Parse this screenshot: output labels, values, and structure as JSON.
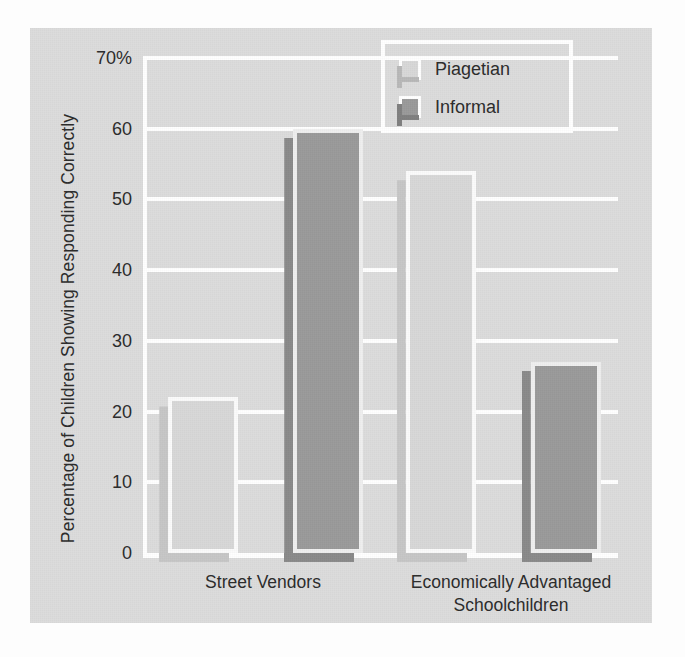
{
  "chart_data": {
    "type": "bar",
    "title": "",
    "subtitle": "",
    "xlabel": "",
    "ylabel": "Percentage of Children Showing Responding Correctly",
    "categories": [
      "Street Vendors",
      "Economically Advantaged Schoolchildren"
    ],
    "category_lines": [
      [
        "Street Vendors"
      ],
      [
        "Economically Advantaged",
        "Schoolchildren"
      ]
    ],
    "series": [
      {
        "name": "Piagetian",
        "values": [
          22,
          54
        ],
        "color": "#d8d8d8"
      },
      {
        "name": "Informal",
        "values": [
          60,
          27
        ],
        "color": "#9a9a9a"
      }
    ],
    "ylim": [
      0,
      70
    ],
    "yticks": [
      70,
      60,
      50,
      40,
      30,
      20,
      10,
      0
    ],
    "ytick_labels": [
      "70%",
      "60",
      "50",
      "40",
      "30",
      "20",
      "10",
      "0"
    ],
    "grid": true,
    "grid_color": "#ffffff",
    "legend_position": "top-right",
    "legend_entries": [
      "Piagetian",
      "Informal"
    ],
    "background_color": "#dcdcdc"
  },
  "legend": {
    "items": [
      {
        "label": "Piagetian"
      },
      {
        "label": "Informal"
      }
    ]
  },
  "axes": {
    "y_title": "Percentage of Children Showing Responding Correctly",
    "tick_labels": [
      "70%",
      "60",
      "50",
      "40",
      "30",
      "20",
      "10",
      "0"
    ],
    "x_labels": {
      "cat0_line0": "Street Vendors",
      "cat1_line0": "Economically Advantaged",
      "cat1_line1": "Schoolchildren"
    }
  }
}
